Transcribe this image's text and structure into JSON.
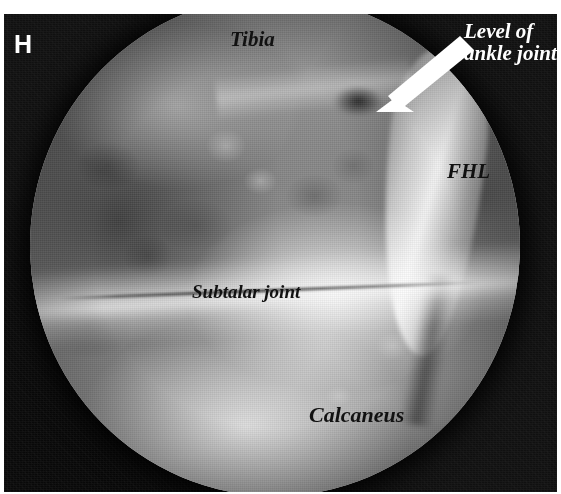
{
  "figure": {
    "panel_letter": "H",
    "modality": "arthroscopic-photograph",
    "view": "circular-endoscopic-field",
    "color_mode": "grayscale"
  },
  "annotations": {
    "tibia": "Tibia",
    "level_of_ankle_joint_line1": "Level of",
    "level_of_ankle_joint_line2": "ankle joint",
    "fhl": "FHL",
    "subtalar_joint": "Subtalar joint",
    "calcaneus": "Calcaneus"
  },
  "pointers": {
    "ankle_joint_arrow": "arrow-icon"
  },
  "colors": {
    "background": "#ffffff",
    "surround": "#0c0c0c",
    "label_dark": "#111111",
    "label_light": "#ffffff",
    "arrow": "#ffffff"
  }
}
